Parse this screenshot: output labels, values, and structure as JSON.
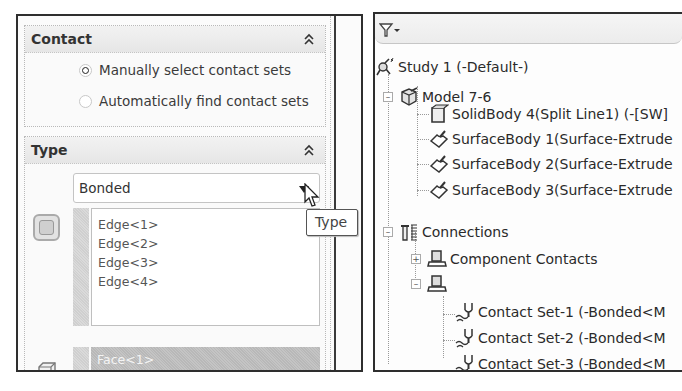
{
  "left_panel": {
    "contact": {
      "title": "Contact",
      "options": [
        {
          "label": "Manually select contact sets",
          "selected": true
        },
        {
          "label": "Automatically find contact sets",
          "selected": false
        }
      ]
    },
    "type": {
      "title": "Type",
      "selected_value": "Bonded",
      "set1_items": [
        "Edge<1>",
        "Edge<2>",
        "Edge<3>",
        "Edge<4>"
      ],
      "set2_items": [
        "Face<1>"
      ]
    },
    "tooltip": "Type"
  },
  "right_panel": {
    "filter_icon": "filter-icon",
    "tree": {
      "study": "Study 1 (-Default-)",
      "model": "Model 7-6",
      "bodies": [
        {
          "label": "SolidBody 4(Split Line1) (-[SW]",
          "icon": "solid-body-icon"
        },
        {
          "label": "SurfaceBody 1(Surface-Extrude",
          "icon": "surface-body-icon"
        },
        {
          "label": "SurfaceBody 2(Surface-Extrude",
          "icon": "surface-body-icon"
        },
        {
          "label": "SurfaceBody 3(Surface-Extrude",
          "icon": "surface-body-icon"
        }
      ],
      "connections": "Connections",
      "component_contacts": "Component Contacts",
      "contact_sets": "Contact Sets",
      "contact_set_items": [
        "Contact Set-1 (-Bonded<M",
        "Contact Set-2 (-Bonded<M",
        "Contact Set-3 (-Bonded<M"
      ]
    }
  }
}
